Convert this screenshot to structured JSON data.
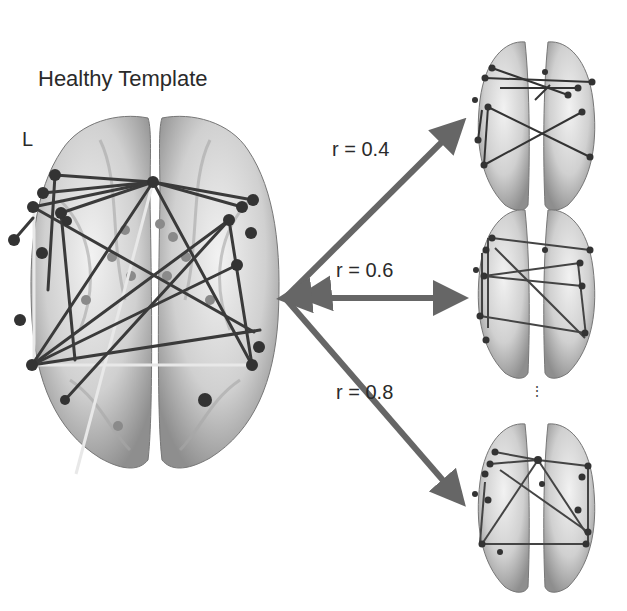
{
  "figure": {
    "title": "Healthy Template",
    "hemisphere_label": "L",
    "arrows": [
      {
        "label": "r = 0.4",
        "target": "top"
      },
      {
        "label": "r = 0.6",
        "target": "middle"
      },
      {
        "label": "r = 0.8",
        "target": "bottom"
      }
    ],
    "continuation": "⋮",
    "colors": {
      "arrow": "#666666",
      "edge_dark": "#3a3a3a",
      "edge_light": "#e6e6e6",
      "node": "#333333",
      "node_faint": "#8a8a8a",
      "brain": "#d4d4d4",
      "brain_shadow": "#9a9a9a"
    }
  }
}
